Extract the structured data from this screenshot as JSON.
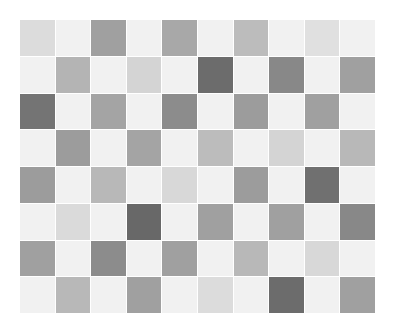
{
  "grid": {
    "rows": 8,
    "cols": 10,
    "cells": [
      [
        "#dcdcdc",
        "#f1f1f1",
        "#a0a0a0",
        "#f1f1f1",
        "#a8a8a8",
        "#f1f1f1",
        "#bcbcbc",
        "#f1f1f1",
        "#e0e0e0",
        "#f1f1f1"
      ],
      [
        "#f1f1f1",
        "#b4b4b4",
        "#f1f1f1",
        "#d4d4d4",
        "#f1f1f1",
        "#6c6c6c",
        "#f1f1f1",
        "#888888",
        "#f1f1f1",
        "#a0a0a0"
      ],
      [
        "#747474",
        "#f1f1f1",
        "#a4a4a4",
        "#f1f1f1",
        "#8c8c8c",
        "#f1f1f1",
        "#9c9c9c",
        "#f1f1f1",
        "#a0a0a0",
        "#f1f1f1"
      ],
      [
        "#f1f1f1",
        "#9c9c9c",
        "#f1f1f1",
        "#a4a4a4",
        "#f1f1f1",
        "#bcbcbc",
        "#f1f1f1",
        "#d4d4d4",
        "#f1f1f1",
        "#b8b8b8"
      ],
      [
        "#9c9c9c",
        "#f1f1f1",
        "#b8b8b8",
        "#f1f1f1",
        "#d8d8d8",
        "#f1f1f1",
        "#9c9c9c",
        "#f1f1f1",
        "#707070",
        "#f1f1f1"
      ],
      [
        "#f1f1f1",
        "#dadada",
        "#f1f1f1",
        "#686868",
        "#f1f1f1",
        "#a0a0a0",
        "#f1f1f1",
        "#a0a0a0",
        "#f1f1f1",
        "#888888"
      ],
      [
        "#a0a0a0",
        "#f1f1f1",
        "#8c8c8c",
        "#f1f1f1",
        "#a0a0a0",
        "#f1f1f1",
        "#b8b8b8",
        "#f1f1f1",
        "#d8d8d8",
        "#f1f1f1"
      ],
      [
        "#f1f1f1",
        "#b8b8b8",
        "#f1f1f1",
        "#a0a0a0",
        "#f1f1f1",
        "#dcdcdc",
        "#f1f1f1",
        "#6c6c6c",
        "#f1f1f1",
        "#a0a0a0"
      ]
    ]
  }
}
